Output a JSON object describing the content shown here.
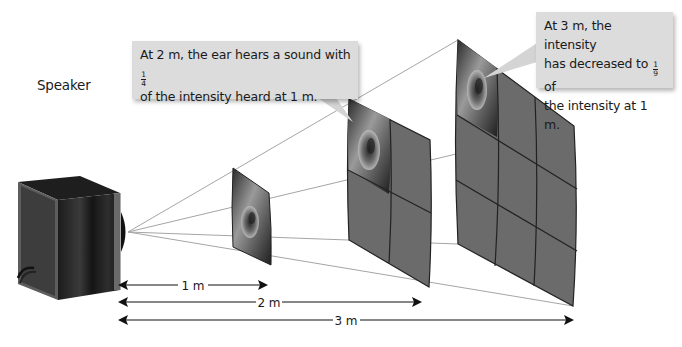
{
  "diagram": {
    "type": "inverse-square-law",
    "speaker_label": "Speaker",
    "callouts": [
      {
        "id": "2m",
        "text_before": "At 2 m, the ear hears a sound with ",
        "fraction": {
          "numerator": "1",
          "denominator": "4"
        },
        "text_after": "of the intensity heard at 1 m."
      },
      {
        "id": "3m",
        "line1": "At 3 m, the intensity",
        "text_before": "has decreased to ",
        "fraction": {
          "numerator": "1",
          "denominator": "9"
        },
        "text_after_inline": " of",
        "line3": "the intensity at 1 m."
      }
    ],
    "panels": [
      {
        "distance": "1 m",
        "grid": "1x1"
      },
      {
        "distance": "2 m",
        "grid": "2x2"
      },
      {
        "distance": "3 m",
        "grid": "3x3"
      }
    ],
    "dimensions": [
      {
        "label": "1 m"
      },
      {
        "label": "2 m"
      },
      {
        "label": "3 m"
      }
    ],
    "colors": {
      "panel_fill": "#6b6b6b",
      "panel_grid": "#222222",
      "callout_bg": "#dcdcdc",
      "ray": "#9a9a9a",
      "speaker_body": "#2a2a2a"
    }
  }
}
